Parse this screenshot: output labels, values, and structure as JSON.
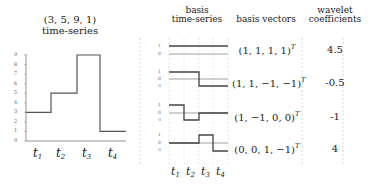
{
  "left_panel": {
    "title_line1": "(3, 5, 9, 1)",
    "title_line2": "time-series",
    "y_ticks": [
      "0",
      "1",
      "2",
      "3",
      "4",
      "5",
      "6",
      "7",
      "8",
      "9"
    ],
    "x_labels": [
      {
        "base": "t",
        "sub": "1"
      },
      {
        "base": "t",
        "sub": "2"
      },
      {
        "base": "t",
        "sub": "3"
      },
      {
        "base": "t",
        "sub": "4"
      }
    ],
    "values": [
      3,
      5,
      9,
      1
    ]
  },
  "right_panel": {
    "headers": {
      "basis_ts_line1": "basis",
      "basis_ts_line2": "time-series",
      "basis_vectors": "basis vectors",
      "coeff_line1": "wavelet",
      "coeff_line2": "coefficients"
    },
    "rows": [
      {
        "vector": "(1, 1, 1, 1)",
        "sup": "T",
        "coefficient": "4.5",
        "ticks": [
          "1",
          "0"
        ],
        "pattern": [
          1,
          1,
          1,
          1
        ]
      },
      {
        "vector": "(1, 1, −1, −1)",
        "sup": "T",
        "coefficient": "-0.5",
        "ticks": [
          "1",
          "0",
          "-1"
        ],
        "pattern": [
          1,
          1,
          -1,
          -1
        ]
      },
      {
        "vector": "(1, −1, 0, 0)",
        "sup": "T",
        "coefficient": "-1",
        "ticks": [
          "1",
          "0",
          "-1"
        ],
        "pattern": [
          1,
          -1,
          0,
          0
        ]
      },
      {
        "vector": "(0, 0, 1, −1)",
        "sup": "T",
        "coefficient": "4",
        "ticks": [
          "1",
          "0",
          "-1"
        ],
        "pattern": [
          0,
          0,
          1,
          -1
        ]
      }
    ],
    "x_labels": [
      {
        "base": "t",
        "sub": "1"
      },
      {
        "base": "t",
        "sub": "2"
      },
      {
        "base": "t",
        "sub": "3"
      },
      {
        "base": "t",
        "sub": "4"
      }
    ]
  }
}
